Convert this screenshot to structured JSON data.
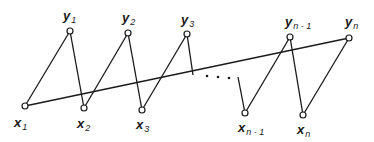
{
  "diagram": {
    "type": "bipartite zigzag path graph",
    "stroke_color": "#1a1a1a",
    "node_fill": "#ffffff",
    "nodes": [
      {
        "id": "x1",
        "label": "x",
        "sub": "1",
        "x": 25,
        "y": 106,
        "lx": 14,
        "ly": 127
      },
      {
        "id": "y1",
        "label": "y",
        "sub": "1",
        "x": 70,
        "y": 31,
        "lx": 63,
        "ly": 20
      },
      {
        "id": "x2",
        "label": "x",
        "sub": "2",
        "x": 84,
        "y": 108,
        "lx": 77,
        "ly": 128
      },
      {
        "id": "y2",
        "label": "y",
        "sub": "2",
        "x": 128,
        "y": 33,
        "lx": 122,
        "ly": 22
      },
      {
        "id": "x3",
        "label": "x",
        "sub": "3",
        "x": 142,
        "y": 110,
        "lx": 136,
        "ly": 129
      },
      {
        "id": "y3",
        "label": "y",
        "sub": "3",
        "x": 187,
        "y": 34,
        "lx": 181,
        "ly": 24
      },
      {
        "id": "xn1",
        "label": "x",
        "sub": "n - 1",
        "x": 245,
        "y": 113,
        "lx": 238,
        "ly": 132
      },
      {
        "id": "yn1",
        "label": "y",
        "sub": "n - 1",
        "x": 290,
        "y": 37,
        "lx": 285,
        "ly": 26
      },
      {
        "id": "xn",
        "label": "x",
        "sub": "n",
        "x": 303,
        "y": 115,
        "lx": 297,
        "ly": 134
      },
      {
        "id": "yn",
        "label": "y",
        "sub": "n",
        "x": 349,
        "y": 38,
        "lx": 345,
        "ly": 26
      }
    ],
    "edges": [
      {
        "from": "x1",
        "to": "y1"
      },
      {
        "from": "y1",
        "to": "x2"
      },
      {
        "from": "x2",
        "to": "y2"
      },
      {
        "from": "y2",
        "to": "x3"
      },
      {
        "from": "x3",
        "to": "y3"
      },
      {
        "from": "xn1",
        "to": "yn1"
      },
      {
        "from": "yn1",
        "to": "xn"
      },
      {
        "from": "xn",
        "to": "yn"
      },
      {
        "from": "x1",
        "to": "yn"
      }
    ],
    "stubs": [
      {
        "x1": 187,
        "y1": 34,
        "x2": 193,
        "y2": 75
      },
      {
        "x1": 238,
        "y1": 77,
        "x2": 245,
        "y2": 113
      }
    ],
    "ellipsis": [
      {
        "x": 207,
        "y": 76
      },
      {
        "x": 218,
        "y": 77
      },
      {
        "x": 229,
        "y": 78
      }
    ]
  }
}
